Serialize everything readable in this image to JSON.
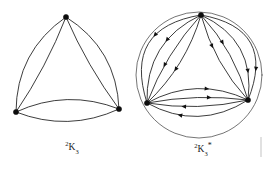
{
  "figure": {
    "background_color": "#ffffff",
    "ink_color": "#1a1a1a",
    "width": 269,
    "height": 171
  },
  "graphs": [
    {
      "id": "left-graph",
      "name": "two-k-three-multigraph",
      "caption": {
        "superscript": "2",
        "base": "K",
        "subscript": "3",
        "star": "",
        "full": "2K3",
        "x": 72,
        "y": 150
      },
      "directed": false,
      "multiplicity": 2,
      "vertices": [
        {
          "id": "top",
          "label": "",
          "x": 66,
          "y": 17
        },
        {
          "id": "bottom-left",
          "label": "",
          "x": 16,
          "y": 112
        },
        {
          "id": "bottom-right",
          "label": "",
          "x": 119,
          "y": 109
        }
      ],
      "edges": [
        {
          "from": "top",
          "to": "bottom-left",
          "bow": 14
        },
        {
          "from": "top",
          "to": "bottom-left",
          "bow": -3
        },
        {
          "from": "top",
          "to": "bottom-right",
          "bow": -14
        },
        {
          "from": "top",
          "to": "bottom-right",
          "bow": 3
        },
        {
          "from": "bottom-left",
          "to": "bottom-right",
          "bow": -11
        },
        {
          "from": "bottom-left",
          "to": "bottom-right",
          "bow": 11
        }
      ]
    },
    {
      "id": "right-graph",
      "name": "two-k-three-star-orientation",
      "caption": {
        "superscript": "2",
        "base": "K",
        "subscript": "3",
        "star": "*",
        "full": "2K3*",
        "x": 203,
        "y": 152
      },
      "directed": true,
      "multiplicity": 4,
      "vertices": [
        {
          "id": "top",
          "label": "",
          "x": 201,
          "y": 15
        },
        {
          "id": "bottom-left",
          "label": "",
          "x": 147,
          "y": 103
        },
        {
          "id": "bottom-right",
          "label": "",
          "x": 248,
          "y": 100
        }
      ],
      "edges": [
        {
          "from": "top",
          "to": "bottom-left",
          "bow": 30,
          "arrow_at": 0.42
        },
        {
          "from": "top",
          "to": "bottom-left",
          "bow": 17,
          "arrow_at": 0.4
        },
        {
          "from": "top",
          "to": "bottom-left",
          "bow": 5,
          "arrow_at": 0.62
        },
        {
          "from": "top",
          "to": "bottom-left",
          "bow": -7,
          "arrow_at": 0.6
        },
        {
          "from": "top",
          "to": "bottom-right",
          "bow": -30,
          "arrow_at": 0.78
        },
        {
          "from": "top",
          "to": "bottom-right",
          "bow": -18,
          "arrow_at": 0.76
        },
        {
          "from": "top",
          "to": "bottom-right",
          "bow": -6,
          "arrow_at": 0.38
        },
        {
          "from": "top",
          "to": "bottom-right",
          "bow": 6,
          "arrow_at": 0.36
        },
        {
          "from": "bottom-left",
          "to": "bottom-right",
          "bow": -13,
          "arrow_at": 0.62
        },
        {
          "from": "bottom-left",
          "to": "bottom-right",
          "bow": -4,
          "arrow_at": 0.64
        },
        {
          "from": "bottom-right",
          "to": "bottom-left",
          "bow": -5,
          "arrow_at": 0.66
        },
        {
          "from": "bottom-right",
          "to": "bottom-left",
          "bow": -15,
          "arrow_at": 0.7
        }
      ],
      "enclosing_circle": {
        "cx": 199,
        "cy": 75,
        "r": 63
      }
    }
  ],
  "artifacts": [
    {
      "name": "page-edge-mark",
      "x": 261,
      "y": 137,
      "width": 2,
      "height": 20
    }
  ]
}
